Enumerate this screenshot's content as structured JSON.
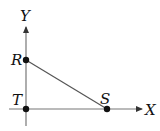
{
  "diagram": {
    "title": "",
    "axes": {
      "x_label": "X",
      "y_label": "Y"
    },
    "points": [
      {
        "name": "R",
        "label": "R",
        "x": 26,
        "y": 60
      },
      {
        "name": "S",
        "label": "S",
        "x": 107,
        "y": 109
      },
      {
        "name": "T",
        "label": "T",
        "x": 26,
        "y": 109
      }
    ],
    "segments": [
      {
        "from": "R",
        "to": "S"
      }
    ],
    "colors": {
      "line": "#555555",
      "point": "#111111",
      "text": "#111111"
    }
  }
}
